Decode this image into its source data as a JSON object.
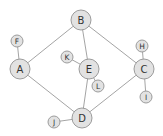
{
  "diagram": {
    "type": "graph",
    "nodes": [
      {
        "id": "B",
        "label": "B",
        "x": 81,
        "y": 20,
        "r": 10
      },
      {
        "id": "A",
        "label": "A",
        "x": 20,
        "y": 69,
        "r": 10
      },
      {
        "id": "E",
        "label": "E",
        "x": 89,
        "y": 69,
        "r": 10
      },
      {
        "id": "C",
        "label": "C",
        "x": 144,
        "y": 69,
        "r": 10
      },
      {
        "id": "D",
        "label": "D",
        "x": 82,
        "y": 118,
        "r": 10
      },
      {
        "id": "F",
        "label": "F",
        "x": 17,
        "y": 41,
        "r": 6
      },
      {
        "id": "K",
        "label": "K",
        "x": 67,
        "y": 57,
        "r": 6
      },
      {
        "id": "L",
        "label": "L",
        "x": 98,
        "y": 86,
        "r": 6
      },
      {
        "id": "H",
        "label": "H",
        "x": 142,
        "y": 46,
        "r": 6
      },
      {
        "id": "I",
        "label": "I",
        "x": 146,
        "y": 97,
        "r": 6
      },
      {
        "id": "J",
        "label": "J",
        "x": 54,
        "y": 122,
        "r": 6
      }
    ],
    "edges": [
      [
        "B",
        "A"
      ],
      [
        "B",
        "E"
      ],
      [
        "B",
        "C"
      ],
      [
        "A",
        "F"
      ],
      [
        "A",
        "D"
      ],
      [
        "K",
        "E"
      ],
      [
        "E",
        "L"
      ],
      [
        "E",
        "D"
      ],
      [
        "C",
        "H"
      ],
      [
        "C",
        "I"
      ],
      [
        "C",
        "D"
      ],
      [
        "D",
        "J"
      ]
    ],
    "colors": {
      "node_fill": "#e2e2e2",
      "node_stroke": "#9c9c9c",
      "edge": "#9a9a9a",
      "label": "#333333"
    }
  }
}
